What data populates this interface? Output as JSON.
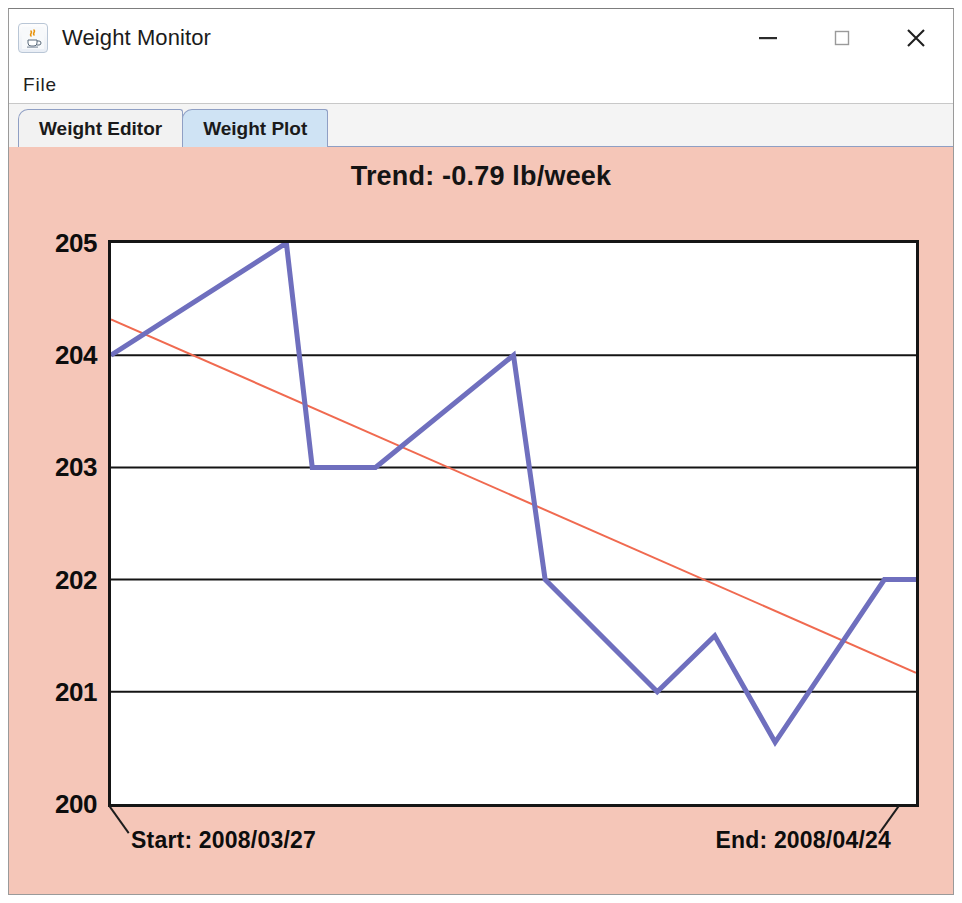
{
  "window": {
    "title": "Weight Monitor",
    "icon": "java-coffee-cup-icon",
    "controls": {
      "minimize": "–",
      "maximize": "□",
      "close": "×"
    }
  },
  "menubar": {
    "items": [
      {
        "label": "File"
      }
    ]
  },
  "tabs": [
    {
      "label": "Weight Editor",
      "selected": false
    },
    {
      "label": "Weight Plot",
      "selected": true
    }
  ],
  "plot_panel": {
    "background_color": "#f5c6b8",
    "start_label": "Start: 2008/03/27",
    "end_label": "End: 2008/04/24"
  },
  "chart_data": {
    "type": "line",
    "title": "Trend: -0.79 lb/week",
    "xlabel": "",
    "ylabel": "",
    "ylim": [
      200,
      205
    ],
    "yticks": [
      200,
      201,
      202,
      203,
      204,
      205
    ],
    "ytick_labels": [
      "200",
      "201",
      "202",
      "203",
      "204",
      "205"
    ],
    "grid": true,
    "legend": "none",
    "x_start_label": "Start: 2008/03/27",
    "x_end_label": "End: 2008/04/24",
    "x_domain": [
      0,
      28
    ],
    "x_unit": "days since 2008/03/27",
    "series": [
      {
        "name": "Weight",
        "color": "#6f6fbe",
        "line_width": 5,
        "x": [
          0,
          6.1,
          7.0,
          9.2,
          14.0,
          15.1,
          19.0,
          21.0,
          23.1,
          26.9,
          28.0
        ],
        "values": [
          204.0,
          205.0,
          203.0,
          203.0,
          204.0,
          202.0,
          201.0,
          201.5,
          200.55,
          202.0,
          202.0
        ]
      },
      {
        "name": "Trend",
        "color": "#f06a50",
        "line_width": 2,
        "x": [
          0,
          28
        ],
        "values": [
          204.32,
          201.17
        ]
      }
    ],
    "trend_slope_per_week": -0.79,
    "trend_units": "lb/week"
  }
}
